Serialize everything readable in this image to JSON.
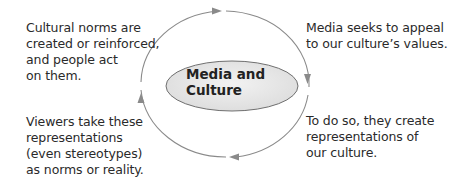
{
  "diagram": {
    "type": "cycle",
    "center": {
      "label": "Media and\nCulture"
    },
    "steps": [
      {
        "position": "top-right",
        "text": "Media seeks to appeal\nto our culture’s values."
      },
      {
        "position": "bottom-right",
        "text": "To do so, they create\nrepresentations of\nour culture."
      },
      {
        "position": "bottom-left",
        "text": "Viewers take these\nrepresentations\n(even stereotypes)\nas norms or reality."
      },
      {
        "position": "top-left",
        "text": "Cultural norms are\ncreated or reinforced,\nand people act\non them."
      }
    ],
    "direction": "clockwise",
    "colors": {
      "arrow": "#8a8a8a",
      "ellipse_fill": "#e6e6e6",
      "ellipse_stroke": "#6f6f6f",
      "text": "#2a2a2a"
    }
  }
}
